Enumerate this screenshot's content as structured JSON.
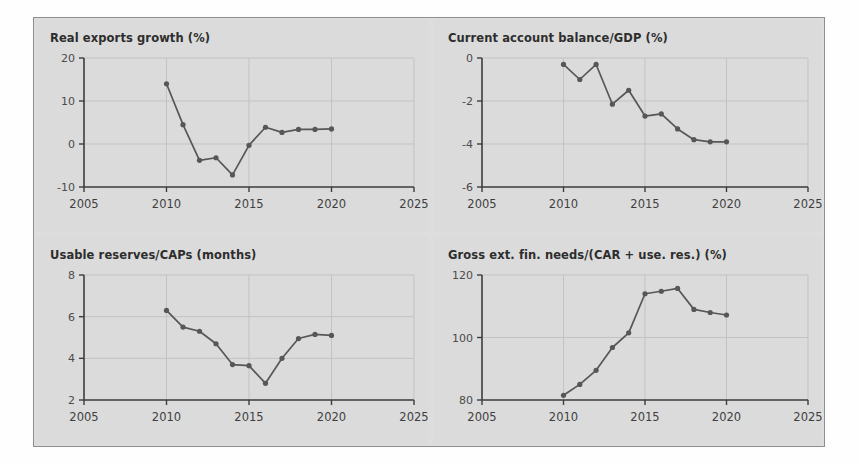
{
  "figure": {
    "panel_background": "#dcdcdc",
    "border_color": "#8d8d8d",
    "line_color": "#555555",
    "grid_color": "#c3c3c3"
  },
  "chart_data": [
    {
      "type": "line",
      "title": "Real exports growth (%)",
      "xlabel": "",
      "ylabel": "",
      "xlim": [
        2005,
        2025
      ],
      "ylim": [
        -10,
        20
      ],
      "xticks": [
        2005,
        2010,
        2015,
        2020,
        2025
      ],
      "xtick_labels": [
        "2005",
        "2010",
        "2015",
        "2020",
        "2025"
      ],
      "yticks": [
        -10,
        0,
        10,
        20
      ],
      "ytick_labels": [
        "-10",
        "0",
        "10",
        "20"
      ],
      "grid": true,
      "legend": "none",
      "x": [
        2010,
        2011,
        2012,
        2013,
        2014,
        2015,
        2016,
        2017,
        2018,
        2019,
        2020
      ],
      "values": [
        14.0,
        4.5,
        -3.8,
        -3.2,
        -7.2,
        -0.3,
        3.9,
        2.7,
        3.4,
        3.4,
        3.5
      ]
    },
    {
      "type": "line",
      "title": "Current account balance/GDP (%)",
      "xlabel": "",
      "ylabel": "",
      "xlim": [
        2005,
        2025
      ],
      "ylim": [
        -6,
        0
      ],
      "xticks": [
        2005,
        2010,
        2015,
        2020,
        2025
      ],
      "xtick_labels": [
        "2005",
        "2010",
        "2015",
        "2020",
        "2025"
      ],
      "yticks": [
        -6,
        -4,
        -2,
        0
      ],
      "ytick_labels": [
        "-6",
        "-4",
        "-2",
        "0"
      ],
      "grid": true,
      "legend": "none",
      "x": [
        2010,
        2011,
        2012,
        2013,
        2014,
        2015,
        2016,
        2017,
        2018,
        2019,
        2020
      ],
      "values": [
        -0.3,
        -1.0,
        -0.3,
        -2.15,
        -1.5,
        -2.7,
        -2.6,
        -3.3,
        -3.8,
        -3.9,
        -3.9
      ]
    },
    {
      "type": "line",
      "title": "Usable reserves/CAPs (months)",
      "xlabel": "",
      "ylabel": "",
      "xlim": [
        2005,
        2025
      ],
      "ylim": [
        2,
        8
      ],
      "xticks": [
        2005,
        2010,
        2015,
        2020,
        2025
      ],
      "xtick_labels": [
        "2005",
        "2010",
        "2015",
        "2020",
        "2025"
      ],
      "yticks": [
        2,
        4,
        6,
        8
      ],
      "ytick_labels": [
        "2",
        "4",
        "6",
        "8"
      ],
      "grid": true,
      "legend": "none",
      "x": [
        2010,
        2011,
        2012,
        2013,
        2014,
        2015,
        2016,
        2017,
        2018,
        2019,
        2020
      ],
      "values": [
        6.3,
        5.5,
        5.3,
        4.7,
        3.7,
        3.65,
        2.8,
        4.0,
        4.95,
        5.15,
        5.1
      ]
    },
    {
      "type": "line",
      "title": "Gross ext. fin. needs/(CAR + use. res.) (%)",
      "xlabel": "",
      "ylabel": "",
      "xlim": [
        2005,
        2025
      ],
      "ylim": [
        80,
        120
      ],
      "xticks": [
        2005,
        2010,
        2015,
        2020,
        2025
      ],
      "xtick_labels": [
        "2005",
        "2010",
        "2015",
        "2020",
        "2025"
      ],
      "yticks": [
        80,
        100,
        120
      ],
      "ytick_labels": [
        "80",
        "100",
        "120"
      ],
      "grid": true,
      "legend": "none",
      "x": [
        2010,
        2011,
        2012,
        2013,
        2014,
        2015,
        2016,
        2017,
        2018,
        2019,
        2020
      ],
      "values": [
        81.5,
        85.0,
        89.5,
        96.8,
        101.5,
        114.0,
        114.8,
        115.7,
        109.0,
        108.0,
        107.2
      ]
    }
  ]
}
